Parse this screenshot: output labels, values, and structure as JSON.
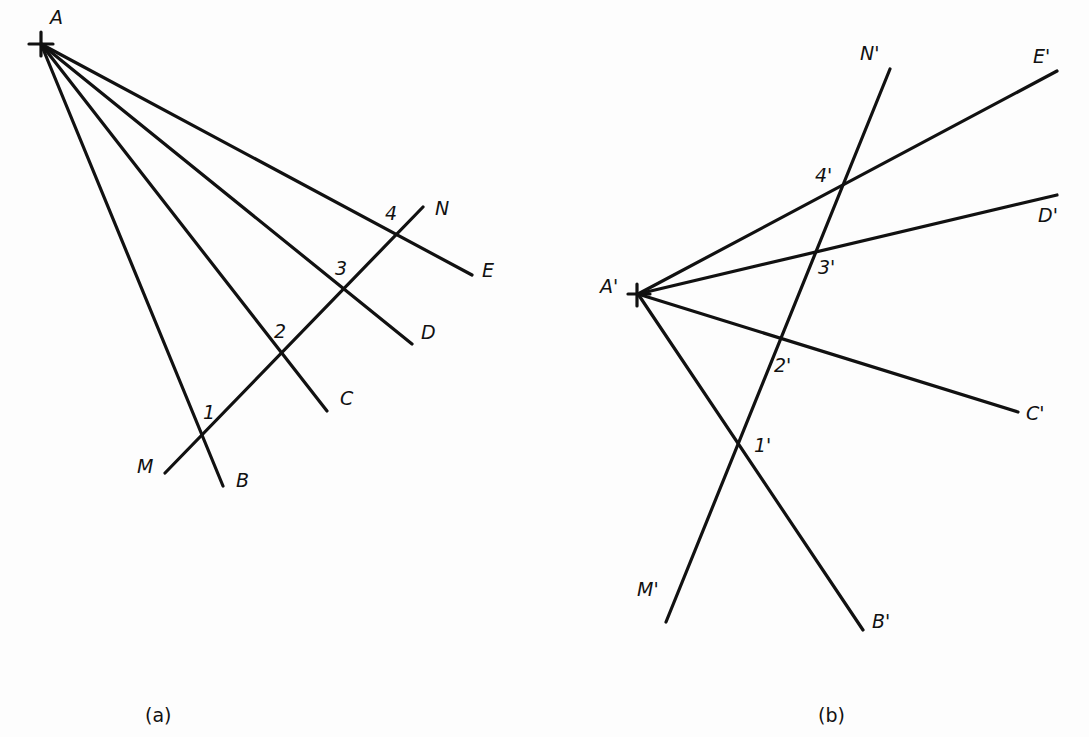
{
  "figure": {
    "panel_a": {
      "caption": "(a)",
      "vertex_label": "A",
      "ray_labels": [
        "B",
        "C",
        "D",
        "E"
      ],
      "transversal_labels": [
        "M",
        "N"
      ],
      "intersection_labels": [
        "1",
        "2",
        "3",
        "4"
      ]
    },
    "panel_b": {
      "caption": "(b)",
      "vertex_label": "A'",
      "ray_labels": [
        "B'",
        "C'",
        "D'",
        "E'"
      ],
      "transversal_labels": [
        "M'",
        "N'"
      ],
      "intersection_labels": [
        "1'",
        "2'",
        "3'",
        "4'"
      ]
    }
  }
}
